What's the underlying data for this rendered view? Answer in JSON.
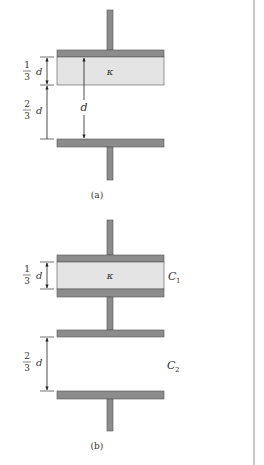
{
  "figures": [
    {
      "id": "a",
      "caption": "(a)",
      "dielectric_label": "κ",
      "dimensions": {
        "top_gap": {
          "num": "1",
          "den": "3",
          "var": "d"
        },
        "bottom_gap": {
          "num": "2",
          "den": "3",
          "var": "d"
        },
        "total": "d"
      }
    },
    {
      "id": "b",
      "caption": "(b)",
      "dielectric_label": "κ",
      "capacitor_labels": [
        "C",
        "C"
      ],
      "capacitor_subscripts": [
        "1",
        "2"
      ],
      "dimensions": {
        "top_gap": {
          "num": "1",
          "den": "3",
          "var": "d"
        },
        "bottom_gap": {
          "num": "2",
          "den": "3",
          "var": "d"
        }
      }
    }
  ],
  "colors": {
    "plate": "#8c8c8c",
    "plate_edge": "#555555",
    "dielectric": "#e4e4e4",
    "divider": "#b5b5b5"
  }
}
